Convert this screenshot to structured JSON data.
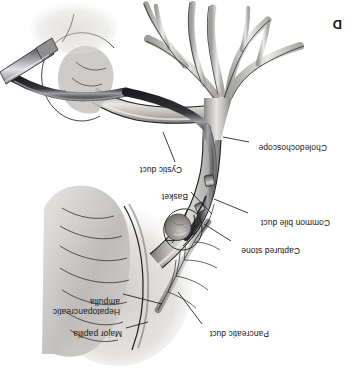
{
  "figure": {
    "panel_letter": "D",
    "orientation_degrees": 180,
    "modality": "line-and-wash medical illustration",
    "palette": {
      "background": "#ffffff",
      "duct_light": "#e9e8e6",
      "duct_mid": "#b9b7b4",
      "duct_dark": "#6f6d6b",
      "outline": "#1b1b1b",
      "scope_dark": "#2b2b2d",
      "scope_highlight": "#9a9a9e",
      "label_text": "#141414",
      "leader_line": "#1b1b1b",
      "stone": "#8e8b86",
      "duodenum_wash": "#c9c7c4"
    },
    "labels": [
      {
        "id": "major-papilla",
        "text": "Major papilla",
        "lines": [
          "Major papilla"
        ],
        "text_x": 232,
        "text_y": 52,
        "leader_from_x": 228,
        "leader_from_y": 56,
        "leader_to_x": 206,
        "leader_to_y": 62
      },
      {
        "id": "hepatopancreatic-ampulla",
        "text": "Hepatopancreatic ampulla",
        "lines": [
          "Hepatopancreatic",
          "ampulla"
        ],
        "text_x": 234,
        "text_y": 74,
        "leader_from_x": 231,
        "leader_from_y": 90,
        "leader_to_x": 192,
        "leader_to_y": 80
      },
      {
        "id": "pancreatic-duct",
        "text": "Pancreatic duct",
        "lines": [
          "Pancreatic duct"
        ],
        "text_x": 85,
        "text_y": 52,
        "leader_from_x": 152,
        "leader_from_y": 60,
        "leader_to_x": 176,
        "leader_to_y": 92
      },
      {
        "id": "captured-stone",
        "text": "Captured stone",
        "lines": [
          "Captured stone"
        ],
        "text_x": 54,
        "text_y": 135,
        "leader_from_x": 123,
        "leader_from_y": 143,
        "leader_to_x": 150,
        "leader_to_y": 160
      },
      {
        "id": "common-bile-duct",
        "text": "Common bile duct",
        "lines": [
          "Common bile duct"
        ],
        "text_x": 24,
        "text_y": 163,
        "leader_from_x": 106,
        "leader_from_y": 171,
        "leader_to_x": 140,
        "leader_to_y": 185
      },
      {
        "id": "basket",
        "text": "Basket",
        "lines": [
          "Basket"
        ],
        "text_x": 166,
        "text_y": 189,
        "leader_from_x": 163,
        "leader_from_y": 192,
        "leader_to_x": 142,
        "leader_to_y": 170
      },
      {
        "id": "cystic-duct",
        "text": "Cystic duct",
        "lines": [
          "Cystic duct"
        ],
        "text_x": 172,
        "text_y": 216,
        "leader_from_x": 179,
        "leader_from_y": 222,
        "leader_to_x": 191,
        "leader_to_y": 252
      },
      {
        "id": "choledochoscope",
        "text": "Choledochoscope",
        "lines": [
          "Choledochoscope"
        ],
        "text_x": 27,
        "text_y": 238,
        "leader_from_x": 105,
        "leader_from_y": 242,
        "leader_to_x": 131,
        "leader_to_y": 247
      }
    ],
    "panel_letter_position": {
      "x": 330,
      "y": 8
    },
    "structures": [
      {
        "id": "intrahepatic-ducts",
        "name": "Intrahepatic biliary radicles"
      },
      {
        "id": "common-hepatic-duct",
        "name": "Common hepatic duct"
      },
      {
        "id": "common-bile-duct",
        "name": "Common bile duct"
      },
      {
        "id": "cystic-duct",
        "name": "Cystic duct"
      },
      {
        "id": "pancreatic-duct",
        "name": "Pancreatic duct"
      },
      {
        "id": "duodenal-wall",
        "name": "Duodenal wall with mucosal folds"
      },
      {
        "id": "major-papilla",
        "name": "Major duodenal papilla"
      },
      {
        "id": "ampulla",
        "name": "Hepatopancreatic ampulla"
      },
      {
        "id": "choledochoscope",
        "name": "Flexible choledochoscope"
      },
      {
        "id": "basket",
        "name": "Wire retrieval basket"
      },
      {
        "id": "stone",
        "name": "Captured ductal stone"
      },
      {
        "id": "trocar",
        "name": "Laparoscopic trocar / port"
      }
    ]
  }
}
